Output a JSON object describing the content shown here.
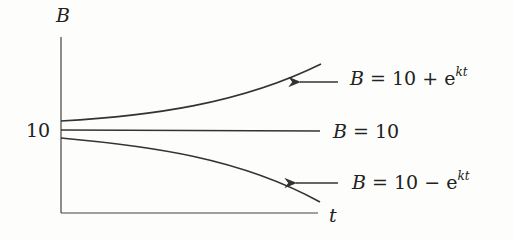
{
  "diagram": {
    "axes": {
      "y_label": "B",
      "x_label": "t",
      "y_tick_label": "10"
    },
    "curves": [
      {
        "id": "upper",
        "label_lhs": "B",
        "label_eq": " = 10 + e",
        "label_sup": "kt",
        "has_arrow": true
      },
      {
        "id": "middle",
        "label_lhs": "B",
        "label_eq": " = 10",
        "label_sup": "",
        "has_arrow": false
      },
      {
        "id": "lower",
        "label_lhs": "B",
        "label_eq": " = 10 − e",
        "label_sup": "kt",
        "has_arrow": true
      }
    ],
    "line_color": "#333333"
  }
}
